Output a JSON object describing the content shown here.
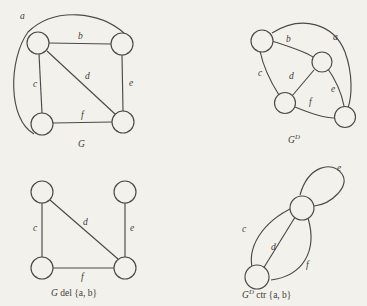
{
  "figure": {
    "background_color": "#f3f1ec",
    "ink_color": "#4b4a47",
    "panels": [
      {
        "id": "G",
        "caption_main": "G",
        "caption_sup": "",
        "caption_tail": "",
        "edge_labels": [
          "a",
          "b",
          "c",
          "d",
          "e",
          "f"
        ],
        "node_count": 4
      },
      {
        "id": "GD",
        "caption_main": "G",
        "caption_sup": "D",
        "caption_tail": "",
        "edge_labels": [
          "a",
          "b",
          "c",
          "d",
          "e",
          "f"
        ],
        "node_count": 4
      },
      {
        "id": "Gdel",
        "caption_main": "G",
        "caption_sup": "",
        "caption_tail": " del {a, b}",
        "edge_labels": [
          "c",
          "d",
          "e",
          "f"
        ],
        "node_count": 4
      },
      {
        "id": "GDctr",
        "caption_main": "G",
        "caption_sup": "D",
        "caption_tail": " ctr {a, b}",
        "edge_labels": [
          "c",
          "d",
          "e",
          "f"
        ],
        "node_count": 2
      }
    ]
  },
  "graph_G": {
    "label_a": "a",
    "label_b": "b",
    "label_c": "c",
    "label_d": "d",
    "label_e": "e",
    "label_f": "f",
    "caption": "G"
  },
  "graph_GD": {
    "label_a": "a",
    "label_b": "b",
    "label_c": "c",
    "label_d": "d",
    "label_e": "e",
    "label_f": "f",
    "caption_main": "G",
    "caption_sup": "D"
  },
  "graph_Gdel": {
    "label_c": "c",
    "label_d": "d",
    "label_e": "e",
    "label_f": "f",
    "caption_main": "G",
    "caption_tail": " del {a, b}"
  },
  "graph_GDctr": {
    "label_c": "c",
    "label_d": "d",
    "label_e": "e",
    "label_f": "f",
    "caption_main": "G",
    "caption_sup": "D",
    "caption_tail": " ctr {a, b}"
  }
}
